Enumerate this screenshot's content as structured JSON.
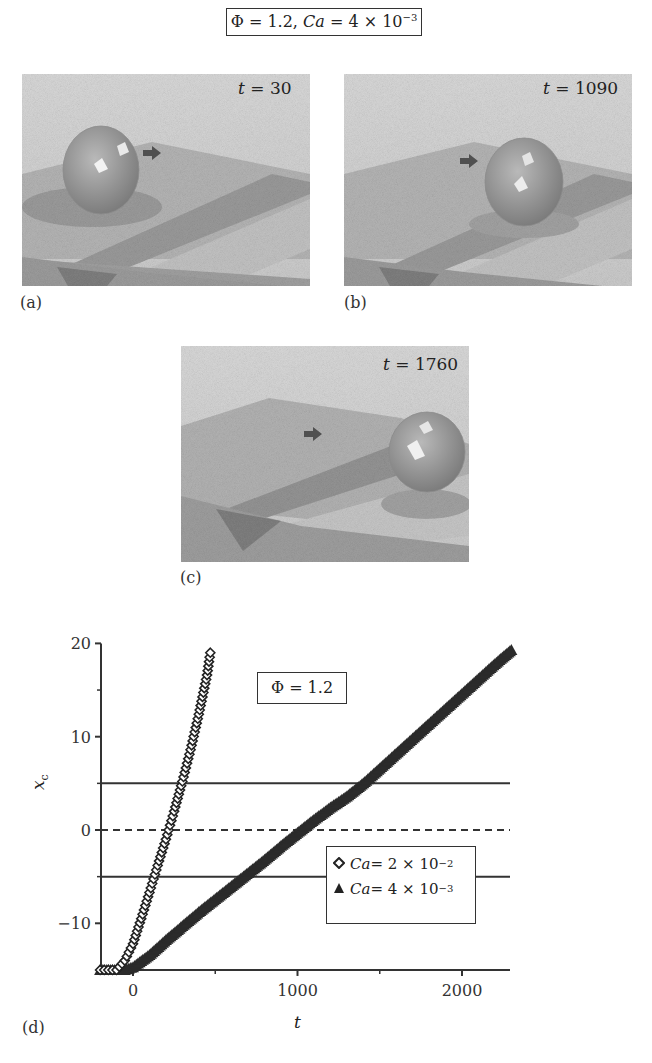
{
  "figure": {
    "title": {
      "phi_label": "Φ = 1.2, ",
      "ca_symbol": "Ca",
      "ca_value": " = 4 × 10",
      "ca_exponent": "−3"
    },
    "panels": [
      {
        "id": "a",
        "label": "(a)",
        "t_symbol": "t",
        "t_value": " = 30",
        "sphere_position": "left, before groove"
      },
      {
        "id": "b",
        "label": "(b)",
        "t_symbol": "t",
        "t_value": " = 1090",
        "sphere_position": "center, over groove"
      },
      {
        "id": "c",
        "label": "(c)",
        "t_symbol": "t",
        "t_value": " = 1760",
        "sphere_position": "right, past groove"
      }
    ],
    "panel_d_label": "(d)",
    "icons": {
      "arrow": "right-arrow-icon",
      "sphere": "droplet-sphere"
    },
    "colors": {
      "background": "#ffffff",
      "axis": "#333333",
      "series_dark": "#2b2b2b",
      "panel_gray": "#a8a8a8"
    }
  },
  "chart_data": {
    "type": "scatter",
    "title": "",
    "xlabel": "t",
    "ylabel": "x_c",
    "xlim": [
      -200,
      2300
    ],
    "ylim": [
      -15,
      20
    ],
    "x_ticks": [
      0,
      1000,
      2000
    ],
    "x_tick_labels": [
      "0",
      "1000",
      "2000"
    ],
    "x_minor_ticks": [
      500,
      1500
    ],
    "y_ticks": [
      -10,
      0,
      10,
      20
    ],
    "y_tick_labels": [
      "−10",
      "0",
      "10",
      "20"
    ],
    "y_minor_ticks": [
      -5,
      5,
      15
    ],
    "grid": false,
    "reference_lines": [
      {
        "y": 5,
        "style": "solid"
      },
      {
        "y": 0,
        "style": "dashed"
      },
      {
        "y": -5,
        "style": "solid"
      }
    ],
    "annotation": {
      "text": "Φ = 1.2"
    },
    "legend_position": "lower right (inside)",
    "series": [
      {
        "name": "Ca = 2 × 10−2",
        "ca_symbol": "Ca",
        "ca_value": " = 2 × 10",
        "ca_exponent": "−2",
        "marker": "open-diamond",
        "x": [
          -200,
          -100,
          -50,
          0,
          50,
          100,
          150,
          200,
          250,
          300,
          350,
          400,
          450,
          470
        ],
        "y": [
          -15,
          -15,
          -14,
          -12.2,
          -9.5,
          -6.7,
          -3.8,
          -1,
          2,
          5.2,
          8.6,
          12.4,
          16.6,
          19
        ]
      },
      {
        "name": "Ca = 4 × 10−3",
        "ca_symbol": "Ca",
        "ca_value": " = 4 × 10",
        "ca_exponent": "−3",
        "marker": "filled-triangle",
        "x": [
          -200,
          -50,
          0,
          100,
          200,
          300,
          400,
          500,
          600,
          700,
          800,
          900,
          1000,
          1100,
          1200,
          1300,
          1400,
          1500,
          1600,
          1700,
          1800,
          1900,
          2000,
          2100,
          2200,
          2300
        ],
        "y": [
          -15,
          -15,
          -14.7,
          -13.4,
          -11.8,
          -10.3,
          -8.8,
          -7.4,
          -6.0,
          -4.6,
          -3.2,
          -1.7,
          -0.3,
          1.1,
          2.4,
          3.6,
          5.0,
          6.6,
          8.2,
          9.8,
          11.4,
          13.0,
          14.6,
          16.2,
          17.8,
          19.3
        ]
      }
    ]
  }
}
